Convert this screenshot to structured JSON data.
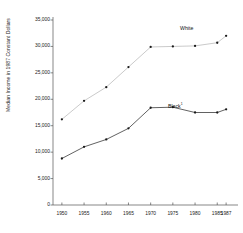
{
  "chart_data": {
    "type": "line",
    "title": "",
    "xlabel": "",
    "ylabel": "Median Income in 1987 Constant Dollars",
    "x": [
      1950,
      1955,
      1960,
      1965,
      1970,
      1975,
      1980,
      1985,
      1987
    ],
    "xtick_labels": [
      "1950",
      "1955",
      "1960",
      "1965",
      "1970",
      "1975",
      "1980",
      "1985",
      "1987"
    ],
    "ytick_values": [
      0,
      5000,
      10000,
      15000,
      20000,
      25000,
      30000,
      35000
    ],
    "ytick_labels": [
      "0",
      "5,000",
      "10,000",
      "15,000",
      "20,000",
      "25,000",
      "30,000",
      "35,000"
    ],
    "xlim": [
      1948,
      1989
    ],
    "ylim": [
      0,
      35000
    ],
    "grid": false,
    "legend_position": "inline-annotation",
    "series": [
      {
        "name": "White",
        "label": "White",
        "footnote_marker": "",
        "color": "#bdbdbd",
        "marker_color": "#1a1a1a",
        "label_x": 180,
        "label_y": 25,
        "values": [
          16200,
          19700,
          22300,
          26100,
          29900,
          30000,
          30100,
          30700,
          32000
        ]
      },
      {
        "name": "Black",
        "label": "Black",
        "footnote_marker": "1",
        "color": "#3a3a3a",
        "marker_color": "#1a1a1a",
        "label_x": 168,
        "label_y": 102,
        "values": [
          8800,
          11000,
          12400,
          14500,
          18400,
          18500,
          17500,
          17500,
          18100
        ]
      }
    ],
    "plot_area": {
      "left": 53,
      "top": 20,
      "right": 235,
      "bottom": 205
    }
  }
}
